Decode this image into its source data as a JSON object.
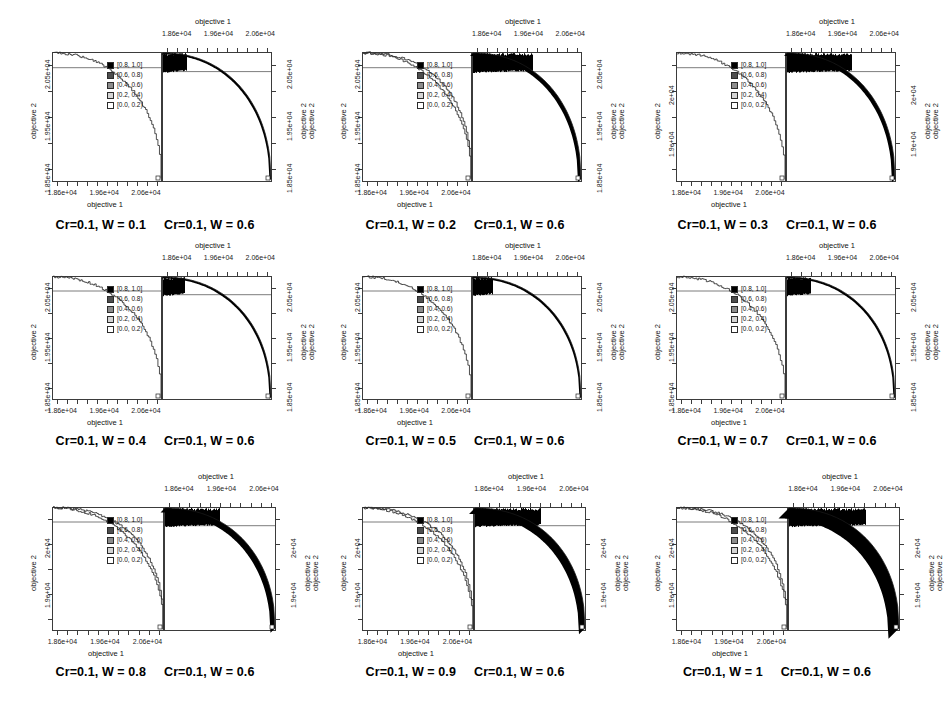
{
  "figure": {
    "type": "grid-of-plots",
    "rows": 3,
    "cols": 3,
    "background_color": "#ffffff",
    "axis_color": "#3b3b3b"
  },
  "legend": {
    "title": "",
    "entries": [
      {
        "label": "[0.8, 1.0]",
        "color": "#000000"
      },
      {
        "label": "[0.6, 0.8)",
        "color": "#4d4d4d"
      },
      {
        "label": "[0.4, 0.6)",
        "color": "#8c8c8c"
      },
      {
        "label": "[0.2, 0.4)",
        "color": "#d4d4d4"
      },
      {
        "label": "[0.0, 0.2)",
        "color": "#ffffff"
      }
    ]
  },
  "axes": {
    "x_title": "objective 1",
    "y_title": "objective 2",
    "x_ticklabels": [
      "1.86e+04",
      "1.96e+04",
      "2.06e+04"
    ],
    "y_ticklabels_a": [
      "2.05e+04",
      "1.95e+04",
      "1.85e+04"
    ],
    "y_ticklabels_b": [
      "2e+04",
      "1.9e+04"
    ]
  },
  "chart_data": {
    "type": "scatter",
    "xlabel": "objective 1",
    "ylabel": "objective 2",
    "xlim": [
      18600,
      20600
    ],
    "ylim": [
      18500,
      20500
    ],
    "grid": false,
    "legend_position": "center-left inside panel",
    "legend_entries": [
      "[0.8, 1.0]",
      "[0.6, 0.8)",
      "[0.4, 0.6)",
      "[0.2, 0.4)",
      "[0.0, 0.2)"
    ],
    "panels": [
      {
        "id": "p1",
        "row": 1,
        "col": 1,
        "caption_left": "Cr=0.1, W = 0.1",
        "caption_right": "Cr=0.1, W = 0.6",
        "x_ticklabels": [
          "1.86e+04",
          "1.96e+04",
          "2.06e+04"
        ],
        "y_ticklabels": [
          "2.05e+04",
          "1.95e+04",
          "1.85e+04"
        ],
        "left_curves": 1,
        "right_density_width": 0.22,
        "right_band_thickness": 2
      },
      {
        "id": "p2",
        "row": 1,
        "col": 2,
        "caption_left": "Cr=0.1, W = 0.2",
        "caption_right": "Cr=0.1, W = 0.6",
        "x_ticklabels": [
          "1.86e+04",
          "1.96e+04",
          "2.06e+04"
        ],
        "y_ticklabels": [
          "2.05e+04",
          "1.95e+04",
          "1.85e+04"
        ],
        "left_curves": 2,
        "right_density_width": 0.55,
        "right_band_thickness": 4
      },
      {
        "id": "p3",
        "row": 1,
        "col": 3,
        "caption_left": "Cr=0.1, W = 0.3",
        "caption_right": "Cr=0.1, W = 0.6",
        "x_ticklabels": [
          "1.86e+04",
          "1.96e+04",
          "2.06e+04"
        ],
        "y_ticklabels": [
          "2e+04",
          "1.9e+04"
        ],
        "left_curves": 1,
        "right_density_width": 0.6,
        "right_band_thickness": 4
      },
      {
        "id": "p4",
        "row": 2,
        "col": 1,
        "caption_left": "Cr=0.1, W = 0.4",
        "caption_right": "Cr=0.1, W = 0.6",
        "x_ticklabels": [
          "1.86e+04",
          "1.96e+04",
          "2.06e+04"
        ],
        "y_ticklabels": [
          "2.05e+04",
          "1.95e+04",
          "1.85e+04"
        ],
        "left_curves": 1,
        "right_density_width": 0.2,
        "right_band_thickness": 2
      },
      {
        "id": "p5",
        "row": 2,
        "col": 2,
        "caption_left": "Cr=0.1, W = 0.5",
        "caption_right": "Cr=0.1, W = 0.6",
        "x_ticklabels": [
          "1.86e+04",
          "1.96e+04",
          "2.06e+04"
        ],
        "y_ticklabels": [
          "2.05e+04",
          "1.95e+04",
          "1.85e+04"
        ],
        "left_curves": 1,
        "right_density_width": 0.18,
        "right_band_thickness": 2
      },
      {
        "id": "p6",
        "row": 2,
        "col": 3,
        "caption_left": "Cr=0.1, W = 0.7",
        "caption_right": "Cr=0.1, W = 0.6",
        "x_ticklabels": [
          "1.86e+04",
          "1.96e+04",
          "2.06e+04"
        ],
        "y_ticklabels": [
          "2.05e+04",
          "1.95e+04",
          "1.85e+04"
        ],
        "left_curves": 1,
        "right_density_width": 0.22,
        "right_band_thickness": 2
      },
      {
        "id": "p7",
        "row": 3,
        "col": 1,
        "caption_left": "Cr=0.1, W = 0.8",
        "caption_right": "Cr=0.1, W = 0.6",
        "x_ticklabels": [
          "1.86e+04",
          "1.96e+04",
          "2.06e+04"
        ],
        "y_ticklabels": [
          "2e+04",
          "1.9e+04"
        ],
        "left_curves": 2,
        "right_density_width": 0.5,
        "right_band_thickness": 6
      },
      {
        "id": "p8",
        "row": 3,
        "col": 2,
        "caption_left": "Cr=0.1, W = 0.9",
        "caption_right": "Cr=0.1, W = 0.6",
        "x_ticklabels": [
          "1.86e+04",
          "1.96e+04",
          "2.06e+04"
        ],
        "y_ticklabels": [
          "2e+04",
          "1.9e+04"
        ],
        "left_curves": 2,
        "right_density_width": 0.6,
        "right_band_thickness": 8
      },
      {
        "id": "p9",
        "row": 3,
        "col": 3,
        "caption_left": "Cr=0.1, W = 1",
        "caption_right": "Cr=0.1, W = 0.6",
        "x_ticklabels": [
          "1.86e+04",
          "1.96e+04",
          "2.06e+04"
        ],
        "y_ticklabels": [
          "2e+04",
          "1.9e+04"
        ],
        "left_curves": 2,
        "right_density_width": 0.7,
        "right_band_thickness": 14
      }
    ]
  }
}
